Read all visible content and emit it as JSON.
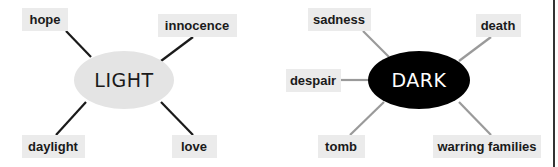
{
  "colors": {
    "box_fill": "#ebebeb",
    "light_ellipse_fill": "#e4e4e4",
    "light_line": "#1a1a1a",
    "dark_ellipse_fill": "#000000",
    "dark_line": "#9a9a9a",
    "border": "#333333"
  },
  "diagrams": [
    {
      "center": {
        "label": "LIGHT"
      },
      "nodes": [
        {
          "label": "hope"
        },
        {
          "label": "innocence"
        },
        {
          "label": "daylight"
        },
        {
          "label": "love"
        }
      ]
    },
    {
      "center": {
        "label": "DARK"
      },
      "nodes": [
        {
          "label": "sadness"
        },
        {
          "label": "death"
        },
        {
          "label": "despair"
        },
        {
          "label": "tomb"
        },
        {
          "label": "warring families"
        }
      ]
    }
  ]
}
